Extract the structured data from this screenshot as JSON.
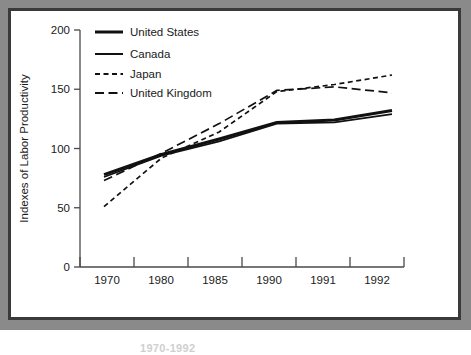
{
  "figure": {
    "frame_color": "#8a8a8a",
    "inner_border_color": "#3a3a3a",
    "background": "#ffffff"
  },
  "caption": {
    "text": "1970-1992"
  },
  "chart_data": {
    "type": "line",
    "title": "",
    "xlabel": "",
    "ylabel": "Indexes of Labor Productivity",
    "categories": [
      "1970",
      "1980",
      "1985",
      "1990",
      "1991",
      "1992"
    ],
    "ylim": [
      0,
      200
    ],
    "yticks": [
      0,
      50,
      100,
      150,
      200
    ],
    "ytick_labels": [
      "0",
      "50",
      "100",
      "150",
      "200"
    ],
    "grid": false,
    "legend_position": "top-left",
    "series": [
      {
        "name": "United States",
        "style": "solid",
        "width": 3,
        "color": "#111111",
        "values": [
          78,
          95,
          108,
          122,
          124,
          132
        ]
      },
      {
        "name": "Canada",
        "style": "solid",
        "width": 1.7,
        "color": "#111111",
        "values": [
          76,
          94,
          106,
          121,
          122,
          129
        ]
      },
      {
        "name": "Japan",
        "style": "dashed-short",
        "width": 1.7,
        "color": "#111111",
        "values": [
          51,
          92,
          114,
          148,
          154,
          162
        ]
      },
      {
        "name": "United Kingdom",
        "style": "dashed-long",
        "width": 1.7,
        "color": "#111111",
        "values": [
          73,
          96,
          121,
          149,
          152,
          147
        ]
      }
    ]
  },
  "legend": {
    "items": [
      {
        "label": "United States",
        "style": "solid-thick"
      },
      {
        "label": "Canada",
        "style": "solid-thin"
      },
      {
        "label": "Japan",
        "style": "dashed-short"
      },
      {
        "label": "United Kingdom",
        "style": "dashed-long"
      }
    ]
  }
}
